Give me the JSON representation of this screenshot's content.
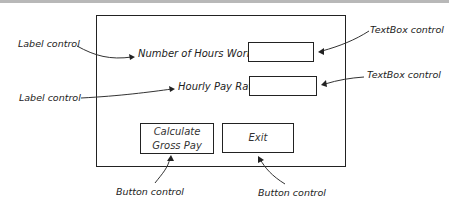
{
  "form": {
    "labels": [
      {
        "text": "Number of Hours Worked"
      },
      {
        "text": "Hourly Pay Rate"
      }
    ],
    "textboxes": [
      {
        "value": ""
      },
      {
        "value": ""
      }
    ],
    "buttons": [
      {
        "line1": "Calculate",
        "line2": "Gross Pay"
      },
      {
        "line1": "Exit"
      }
    ]
  },
  "annotations": {
    "label_control_1": "Label control",
    "label_control_2": "Label control",
    "textbox_control_1": "TextBox control",
    "textbox_control_2": "TextBox control",
    "button_control_1": "Button control",
    "button_control_2": "Button control"
  },
  "colors": {
    "stroke": "#222222",
    "topbar": "#b8b8b8",
    "background": "#ffffff"
  }
}
